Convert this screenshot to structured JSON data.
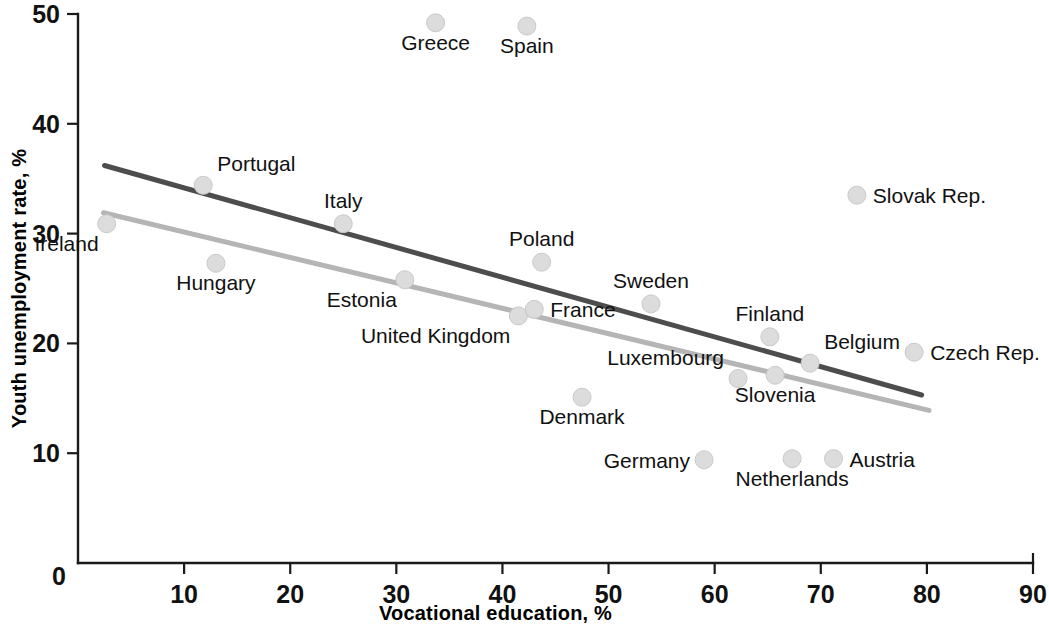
{
  "chart_data": {
    "type": "scatter",
    "title": "",
    "xlabel": "Vocational education, %",
    "ylabel": "Youth unemployment rate, %",
    "xlim": [
      0,
      90
    ],
    "ylim": [
      0,
      50
    ],
    "xticks": [
      0,
      10,
      20,
      30,
      40,
      50,
      60,
      70,
      80,
      90
    ],
    "yticks": [
      0,
      10,
      20,
      30,
      40,
      50
    ],
    "xtick_labels": [
      "0",
      "10",
      "20",
      "30",
      "40",
      "50",
      "60",
      "70",
      "80",
      "90"
    ],
    "ytick_labels": [
      "0",
      "10",
      "20",
      "30",
      "40",
      "50"
    ],
    "grid": false,
    "legend": "none",
    "points": [
      {
        "label": "Ireland",
        "x": 2.7,
        "y": 30.9,
        "label_pos": "below-left"
      },
      {
        "label": "Portugal",
        "x": 11.8,
        "y": 34.4,
        "label_pos": "above-right"
      },
      {
        "label": "Hungary",
        "x": 13.0,
        "y": 27.3,
        "label_pos": "below"
      },
      {
        "label": "Italy",
        "x": 25.0,
        "y": 30.9,
        "label_pos": "above"
      },
      {
        "label": "Estonia",
        "x": 30.8,
        "y": 25.8,
        "label_pos": "below-left"
      },
      {
        "label": "Greece",
        "x": 33.7,
        "y": 49.2,
        "label_pos": "below"
      },
      {
        "label": "United Kingdom",
        "x": 41.5,
        "y": 22.5,
        "label_pos": "below-left"
      },
      {
        "label": "Spain",
        "x": 42.3,
        "y": 48.9,
        "label_pos": "below"
      },
      {
        "label": "France",
        "x": 43.0,
        "y": 23.1,
        "label_pos": "right"
      },
      {
        "label": "Poland",
        "x": 43.7,
        "y": 27.4,
        "label_pos": "above"
      },
      {
        "label": "Denmark",
        "x": 47.5,
        "y": 15.1,
        "label_pos": "below"
      },
      {
        "label": "Sweden",
        "x": 54.0,
        "y": 23.6,
        "label_pos": "above"
      },
      {
        "label": "Germany",
        "x": 59.0,
        "y": 9.4,
        "label_pos": "left"
      },
      {
        "label": "Luxembourg",
        "x": 62.2,
        "y": 16.8,
        "label_pos": "above-left"
      },
      {
        "label": "Slovenia",
        "x": 65.7,
        "y": 17.1,
        "label_pos": "below"
      },
      {
        "label": "Finland",
        "x": 65.2,
        "y": 20.6,
        "label_pos": "above"
      },
      {
        "label": "Netherlands",
        "x": 67.3,
        "y": 9.5,
        "label_pos": "below"
      },
      {
        "label": "Belgium",
        "x": 69.0,
        "y": 18.2,
        "label_pos": "above-right"
      },
      {
        "label": "Austria",
        "x": 71.2,
        "y": 9.5,
        "label_pos": "right"
      },
      {
        "label": "Slovak Rep.",
        "x": 73.4,
        "y": 33.5,
        "label_pos": "right"
      },
      {
        "label": "Czech Rep.",
        "x": 78.8,
        "y": 19.2,
        "label_pos": "right"
      }
    ],
    "trendlines": [
      {
        "name": "upper-trend",
        "color": "#4d4d4d",
        "x0": 2.5,
        "y0": 36.2,
        "x1": 79.5,
        "y1": 15.3
      },
      {
        "name": "lower-trend",
        "color": "#b5b5b5",
        "x0": 2.4,
        "y0": 31.9,
        "x1": 80.2,
        "y1": 13.9
      }
    ]
  }
}
